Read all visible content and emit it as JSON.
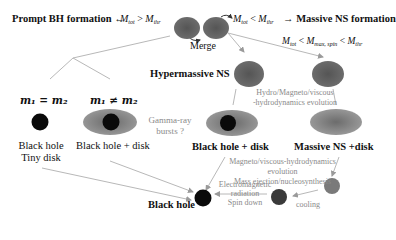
{
  "header": {
    "left_label": "Prompt BH formation",
    "left_arrow": "←",
    "left_condition": {
      "m": "M",
      "sub1": "tot",
      "op": ">",
      "m2": "M",
      "sub2": "thr"
    },
    "right_condition": {
      "m": "M",
      "sub1": "tot",
      "op": "<",
      "m2": "M",
      "sub2": "thr"
    },
    "right_arrow": "→",
    "right_label": "Massive NS formation",
    "spin_condition": {
      "m": "M",
      "sub1": "tot",
      "op1": "<",
      "m2": "M",
      "sub2": "max, spin",
      "op2": "<",
      "m3": "M",
      "sub3": "thr"
    }
  },
  "merge_label": "Merge",
  "branches": {
    "equal_mass": "m₁ = m₂",
    "unequal_mass": "m₁ ≠ m₂"
  },
  "nodes": {
    "hypermassive_ns": "Hypermassive NS",
    "bh_tiny_disk_line1": "Black hole",
    "bh_tiny_disk_line2": "Tiny disk",
    "bh_disk_left": "Black hole + disk",
    "bh_disk_center": "Black hole + disk",
    "massive_ns_disk": "Massive NS +disk",
    "black_hole_final": "Black hole"
  },
  "annotations": {
    "grb_line1": "Gamma-ray",
    "grb_line2": "bursts ?",
    "hydro_line1": "Hydro/Magneto/viscous",
    "hydro_line2": "-hydrodynamics evolution",
    "mvh_line1": "Magneto/viscous-hydrodynamics",
    "mvh_line2": "evolution",
    "mvh_line3": "Mass ejection/nucleosynthesis",
    "em_line1": "Electromagnetic",
    "em_line2": "radiation",
    "spin_down": "Spin down",
    "cooling": "cooling"
  },
  "colors": {
    "ns_gray": "#6a6a6a",
    "ns_dark": "#4a4a4a",
    "disk_gray": "#8e8e8e",
    "bh_black": "#0a0a0a",
    "line_gray": "#b4b4b4",
    "annotation_gray": "#8a8a8a",
    "cooling_ns": "#7a7a7a"
  }
}
